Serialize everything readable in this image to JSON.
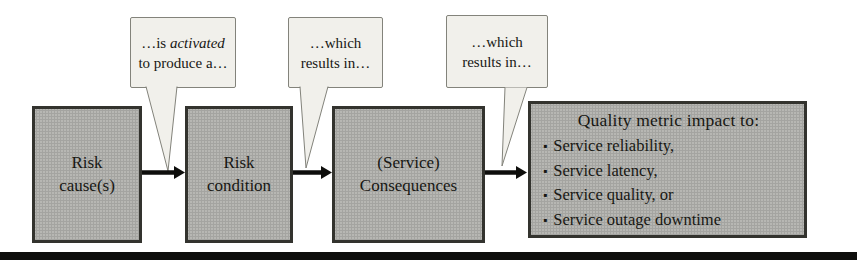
{
  "figure": {
    "type": "flow-diagram",
    "boxes": [
      {
        "label": "Risk cause(s)"
      },
      {
        "label": "Risk condition"
      },
      {
        "label": "(Service) Consequences"
      },
      {
        "heading": "Quality metric impact to:",
        "bullet_glyph": "▪",
        "bullets": [
          "Service reliability,",
          "Service latency,",
          "Service quality, or",
          "Service outage downtime"
        ]
      }
    ],
    "callouts": [
      {
        "prefix": "…is ",
        "emphasis": "activated",
        "suffix": " to produce a…"
      },
      {
        "text": "…which results in…"
      },
      {
        "text": "…which results in…"
      }
    ],
    "arrows": [
      {
        "from": "Risk cause(s)",
        "to": "Risk condition"
      },
      {
        "from": "Risk condition",
        "to": "(Service) Consequences"
      },
      {
        "from": "(Service) Consequences",
        "to": "Quality metric impact to:"
      }
    ],
    "colors": {
      "bg": "#ffffff",
      "box_fill": "#b7b7b3",
      "box_border": "#33332e",
      "bubble_fill": "#f1f0eb",
      "bubble_border": "#83837b",
      "text": "#171713",
      "ink": "#0e0e0c"
    }
  }
}
